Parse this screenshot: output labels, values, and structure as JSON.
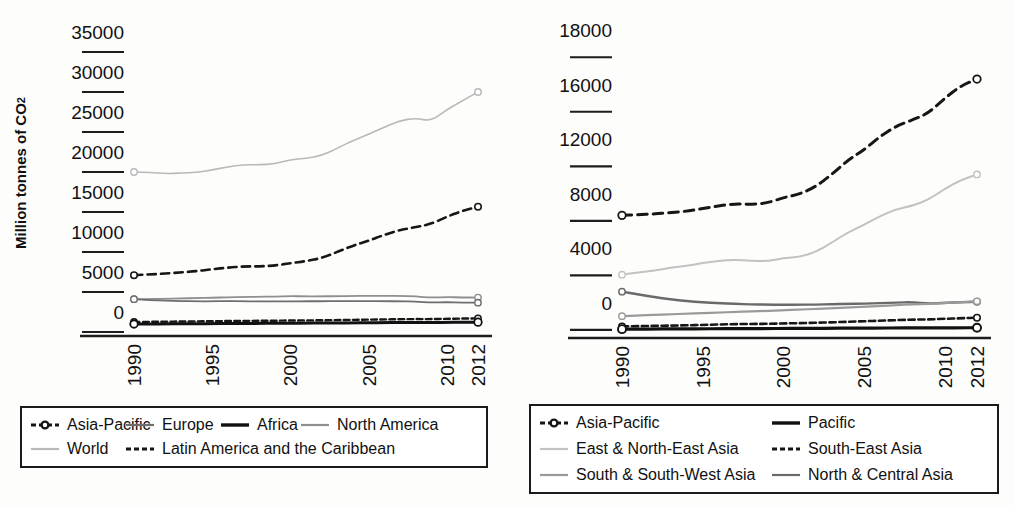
{
  "chart_data": [
    {
      "id": "left",
      "type": "line",
      "title": "",
      "xlabel": "",
      "ylabel": "Million tonnes of CO2",
      "ylabel_prefix": "Million tonnes of CO",
      "ylabel_sub": "2",
      "x": [
        1990,
        1991,
        1992,
        1993,
        1994,
        1995,
        1996,
        1997,
        1998,
        1999,
        2000,
        2001,
        2002,
        2003,
        2004,
        2005,
        2006,
        2007,
        2008,
        2009,
        2010,
        2011,
        2012
      ],
      "xticks": [
        "1990",
        "1995",
        "2000",
        "2005",
        "2010",
        "2012"
      ],
      "xtick_values": [
        1990,
        1995,
        2000,
        2005,
        2010,
        2012
      ],
      "yticks": [
        "0",
        "5000",
        "10000",
        "15000",
        "20000",
        "25000",
        "30000",
        "35000"
      ],
      "ytick_values": [
        0,
        5000,
        10000,
        15000,
        20000,
        25000,
        30000,
        35000
      ],
      "ylim": [
        -3000,
        35000
      ],
      "grid": false,
      "legend_position": "bottom",
      "series": [
        {
          "name": "World",
          "style": "solid",
          "color": "#b9b9b9",
          "width": 1.6,
          "marker": "open-circle-ends",
          "values": [
            17500,
            17450,
            17300,
            17350,
            17450,
            17750,
            18150,
            18400,
            18400,
            18500,
            19050,
            19200,
            19550,
            20450,
            21450,
            22200,
            23100,
            23900,
            24250,
            23850,
            25300,
            26400,
            27500
          ]
        },
        {
          "name": "Asia-Pacific",
          "style": "dashed",
          "color": "#161616",
          "width": 2.6,
          "marker": "open-circle-ends",
          "values": [
            4600,
            4700,
            4800,
            4950,
            5100,
            5350,
            5550,
            5700,
            5700,
            5800,
            6100,
            6350,
            6750,
            7500,
            8300,
            8900,
            9650,
            10250,
            10600,
            11000,
            11900,
            12650,
            13150
          ]
        },
        {
          "name": "North America",
          "style": "solid",
          "color": "#8f8f8f",
          "width": 1.8,
          "marker": "open-circle-ends",
          "values": [
            1600,
            1630,
            1660,
            1700,
            1740,
            1780,
            1850,
            1890,
            1900,
            1920,
            1990,
            1950,
            1960,
            1980,
            2010,
            2020,
            2000,
            2010,
            1940,
            1800,
            1870,
            1820,
            1800
          ]
        },
        {
          "name": "Europe",
          "style": "solid",
          "color": "#6e6e6e",
          "width": 1.8,
          "marker": "open-circle-ends",
          "values": [
            1600,
            1500,
            1420,
            1370,
            1340,
            1340,
            1360,
            1340,
            1340,
            1320,
            1330,
            1350,
            1340,
            1360,
            1360,
            1350,
            1350,
            1340,
            1300,
            1190,
            1230,
            1180,
            1160
          ]
        },
        {
          "name": "Latin America and the Caribbean",
          "style": "dotted-dashed",
          "color": "#161616",
          "width": 2.4,
          "marker": "open-circle-ends",
          "values": [
            -1250,
            -1230,
            -1210,
            -1190,
            -1170,
            -1150,
            -1130,
            -1110,
            -1100,
            -1090,
            -1060,
            -1050,
            -1030,
            -1010,
            -980,
            -950,
            -930,
            -900,
            -880,
            -890,
            -850,
            -820,
            -800
          ]
        },
        {
          "name": "Africa",
          "style": "solid",
          "color": "#111111",
          "width": 3.0,
          "marker": "open-circle-ends",
          "values": [
            -1500,
            -1490,
            -1480,
            -1470,
            -1460,
            -1450,
            -1440,
            -1430,
            -1420,
            -1415,
            -1400,
            -1390,
            -1380,
            -1370,
            -1355,
            -1340,
            -1330,
            -1320,
            -1310,
            -1310,
            -1295,
            -1285,
            -1275
          ]
        }
      ]
    },
    {
      "id": "right",
      "type": "line",
      "title": "",
      "xlabel": "",
      "ylabel": "",
      "x": [
        1990,
        1991,
        1992,
        1993,
        1994,
        1995,
        1996,
        1997,
        1998,
        1999,
        2000,
        2001,
        2002,
        2003,
        2004,
        2005,
        2006,
        2007,
        2008,
        2009,
        2010,
        2011,
        2012
      ],
      "xticks": [
        "1990",
        "1995",
        "2000",
        "2005",
        "2010",
        "2012"
      ],
      "xtick_values": [
        1990,
        1995,
        2000,
        2005,
        2010,
        2012
      ],
      "yticks": [
        "0",
        "4000",
        "8000",
        "12000",
        "16000",
        "18000"
      ],
      "ytick_values": [
        0,
        4000,
        8000,
        12000,
        16000,
        20000
      ],
      "ylim": [
        -2600,
        20000
      ],
      "grid": false,
      "legend_position": "bottom",
      "series": [
        {
          "name": "Asia-Pacific",
          "style": "dashed",
          "color": "#161616",
          "width": 3.0,
          "marker": "open-circle-ends",
          "values": [
            6400,
            6450,
            6500,
            6600,
            6700,
            6900,
            7100,
            7250,
            7200,
            7300,
            7700,
            7950,
            8500,
            9400,
            10450,
            11200,
            12200,
            12950,
            13400,
            13900,
            15000,
            15900,
            16400
          ]
        },
        {
          "name": "East & North-East Asia",
          "style": "solid",
          "color": "#c2c2c2",
          "width": 2.0,
          "marker": "open-circle-ends",
          "values": [
            2050,
            2200,
            2350,
            2550,
            2700,
            2900,
            3050,
            3150,
            3050,
            3050,
            3250,
            3350,
            3700,
            4400,
            5150,
            5700,
            6350,
            6850,
            7100,
            7550,
            8350,
            9000,
            9400
          ]
        },
        {
          "name": "North & Central Asia",
          "style": "solid",
          "color": "#6a6a6a",
          "width": 2.4,
          "marker": "open-circle-ends",
          "values": [
            800,
            600,
            400,
            230,
            110,
            20,
            -40,
            -100,
            -130,
            -150,
            -160,
            -150,
            -150,
            -120,
            -100,
            -80,
            -40,
            0,
            30,
            -80,
            -20,
            30,
            60
          ]
        },
        {
          "name": "South & South-West Asia",
          "style": "solid",
          "color": "#9a9a9a",
          "width": 2.2,
          "marker": "open-circle-ends",
          "values": [
            -1000,
            -950,
            -900,
            -860,
            -820,
            -780,
            -730,
            -690,
            -650,
            -610,
            -560,
            -510,
            -470,
            -420,
            -370,
            -310,
            -250,
            -190,
            -130,
            -90,
            -30,
            30,
            90
          ]
        },
        {
          "name": "South-East Asia",
          "style": "dotted-dashed",
          "color": "#161616",
          "width": 2.6,
          "marker": "open-circle-ends",
          "values": [
            -1750,
            -1730,
            -1710,
            -1690,
            -1670,
            -1640,
            -1610,
            -1580,
            -1570,
            -1560,
            -1530,
            -1510,
            -1480,
            -1450,
            -1410,
            -1370,
            -1330,
            -1290,
            -1250,
            -1240,
            -1190,
            -1150,
            -1110
          ]
        },
        {
          "name": "Pacific",
          "style": "solid",
          "color": "#111111",
          "width": 3.2,
          "marker": "open-circle-ends",
          "values": [
            -1950,
            -1945,
            -1940,
            -1935,
            -1930,
            -1925,
            -1920,
            -1915,
            -1910,
            -1905,
            -1900,
            -1895,
            -1890,
            -1885,
            -1880,
            -1875,
            -1870,
            -1865,
            -1860,
            -1860,
            -1855,
            -1850,
            -1845
          ]
        }
      ]
    }
  ],
  "legend_left": {
    "items": [
      {
        "label": "Asia-Pacific",
        "style": "dashed-marker",
        "color": "#161616"
      },
      {
        "label": "Europe",
        "style": "solid",
        "color": "#6e6e6e"
      },
      {
        "label": "Africa",
        "style": "solid-thick",
        "color": "#111111"
      },
      {
        "label": "North America",
        "style": "solid",
        "color": "#8f8f8f"
      },
      {
        "label": "World",
        "style": "solid",
        "color": "#b9b9b9"
      },
      {
        "label": "Latin America and the Caribbean",
        "style": "dotted-dashed",
        "color": "#161616"
      }
    ]
  },
  "legend_right": {
    "items": [
      {
        "label": "Asia-Pacific",
        "style": "dashed-marker",
        "color": "#161616"
      },
      {
        "label": "Pacific",
        "style": "solid-thick",
        "color": "#111111"
      },
      {
        "label": "East & North-East Asia",
        "style": "solid",
        "color": "#c2c2c2"
      },
      {
        "label": "South-East Asia",
        "style": "dotted-dashed",
        "color": "#161616"
      },
      {
        "label": "South & South-West Asia",
        "style": "solid",
        "color": "#9a9a9a"
      },
      {
        "label": "North & Central Asia",
        "style": "solid",
        "color": "#6a6a6a"
      }
    ]
  }
}
